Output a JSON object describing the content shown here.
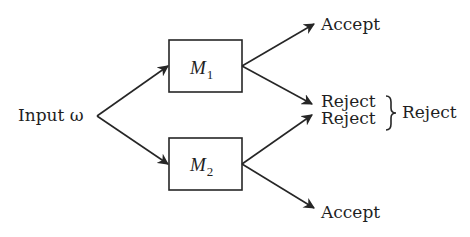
{
  "diagram": {
    "type": "flow",
    "input": {
      "label": "Input ω"
    },
    "machines": [
      {
        "id": "M1",
        "symbol": "M",
        "subscript": "1"
      },
      {
        "id": "M2",
        "symbol": "M",
        "subscript": "2"
      }
    ],
    "outcomes": {
      "m1_accept": "Accept",
      "m1_reject": "Reject",
      "m2_reject": "Reject",
      "m2_accept": "Accept",
      "combined_reject": "Reject"
    },
    "edges": [
      {
        "from": "Input ω",
        "to": "M1"
      },
      {
        "from": "Input ω",
        "to": "M2"
      },
      {
        "from": "M1",
        "to": "Accept"
      },
      {
        "from": "M1",
        "to": "Reject"
      },
      {
        "from": "M2",
        "to": "Reject"
      },
      {
        "from": "M2",
        "to": "Accept"
      }
    ],
    "brace": "}",
    "colors": {
      "stroke": "#262626",
      "text": "#1f1f1f",
      "background": "#ffffff"
    }
  }
}
